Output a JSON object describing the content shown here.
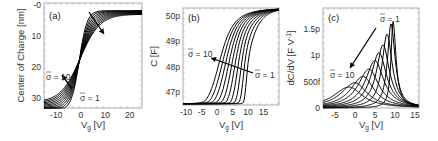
{
  "chart_data": [
    {
      "type": "line",
      "panel": "(a)",
      "title": "",
      "xlabel": "V_g [V]",
      "ylabel": "Center of Charge [nm]",
      "xlim": [
        -15,
        25
      ],
      "ylim": [
        0,
        33
      ],
      "y_inverted": true,
      "xticks": [
        "-10",
        "0",
        "10",
        "20"
      ],
      "yticks": [
        "-0",
        "10",
        "20",
        "30"
      ],
      "annotations": [
        "σ̄ = 10",
        "σ̄ = 1"
      ],
      "series_count": 10,
      "series": [
        {
          "name": "σ̄ = 1",
          "x": [
            -15,
            -5,
            -2,
            0,
            2,
            5,
            10,
            25
          ],
          "values": [
            33.5,
            30,
            25,
            17,
            8,
            4,
            2.5,
            2
          ]
        },
        {
          "name": "σ̄ = 10",
          "x": [
            -15,
            -5,
            -2,
            0,
            2,
            5,
            10,
            25
          ],
          "values": [
            31.5,
            26,
            21,
            16,
            10,
            6,
            4,
            2.2
          ]
        }
      ]
    },
    {
      "type": "line",
      "panel": "(b)",
      "xlabel": "V_g [V]",
      "ylabel": "C [F]",
      "xlim": [
        -11,
        20
      ],
      "ylim": [
        46.5,
        50.3
      ],
      "xticks": [
        "-10",
        "-5",
        "0",
        "5",
        "10",
        "15"
      ],
      "yticks": [
        "47p",
        "48p",
        "49p",
        "50p"
      ],
      "annotations": [
        "σ̄ = 10",
        "σ̄ = 1"
      ],
      "series_count": 10,
      "series": [
        {
          "name": "σ̄ = 1",
          "x": [
            -11,
            8,
            9,
            10,
            12,
            20
          ],
          "values": [
            46.55,
            46.6,
            47.8,
            49.2,
            49.9,
            50.3
          ]
        },
        {
          "name": "σ̄ = 10",
          "x": [
            -11,
            -5,
            -2,
            0,
            3,
            8,
            20
          ],
          "values": [
            46.55,
            46.7,
            47.3,
            48.3,
            49.3,
            49.9,
            50.2
          ]
        }
      ]
    },
    {
      "type": "line",
      "panel": "(c)",
      "xlabel": "V_g [V]",
      "ylabel": "dC/dV [F V^-1]",
      "xlim": [
        -8,
        16
      ],
      "ylim": [
        0,
        1.9
      ],
      "yunit": "pF/V",
      "xticks": [
        "-5",
        "0",
        "5",
        "10",
        "15"
      ],
      "yticks": [
        "0",
        "500f",
        "1p",
        "1.5p"
      ],
      "annotations": [
        "σ̄ = 1",
        "σ̄ = 10"
      ],
      "series_count": 10,
      "peaks": {
        "x": [
          -1.5,
          0,
          2,
          3.5,
          5,
          6,
          7,
          8,
          9,
          9.5
        ],
        "values": [
          0.4,
          0.48,
          0.6,
          0.74,
          0.9,
          1.05,
          1.2,
          1.4,
          1.6,
          1.65
        ]
      }
    }
  ],
  "panels": {
    "a": {
      "label": "(a)",
      "ylabel": "Center of Charge [nm]",
      "xlabel": "V",
      "xsub": "g",
      "xunit": " [V]",
      "ann_top": "σ = 10",
      "ann_bot": "σ = 1"
    },
    "b": {
      "label": "(b)",
      "ylabel": "C [F]",
      "xlabel": "V",
      "xsub": "g",
      "xunit": " [V]",
      "ann_top": "σ = 10",
      "ann_bot": "σ = 1"
    },
    "c": {
      "label": "(c)",
      "ylabel": "dC/dV [F V",
      "ysup": "-1",
      "yclose": "]",
      "xlabel": "V",
      "xsub": "g",
      "xunit": " [V]",
      "ann_top": "σ = 1",
      "ann_bot": "σ = 10"
    }
  }
}
